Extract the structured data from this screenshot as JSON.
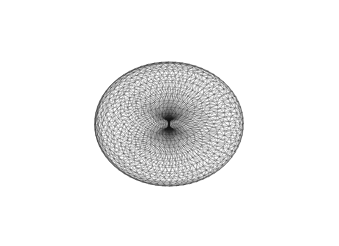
{
  "figure": {
    "background": "#ffffff",
    "stroke_color": "#1a1a1a",
    "canvas": {
      "width": 339,
      "height": 246
    },
    "projection": {
      "center_x": 169,
      "center_y": 124,
      "scale_x": 74.5,
      "scale_y": 66,
      "tilt_deg": 62
    },
    "mesh": {
      "major_radius": 1.0,
      "minor_radius": 1.0,
      "u_segments": 64,
      "v_segments": 30,
      "triangulated": true
    }
  }
}
